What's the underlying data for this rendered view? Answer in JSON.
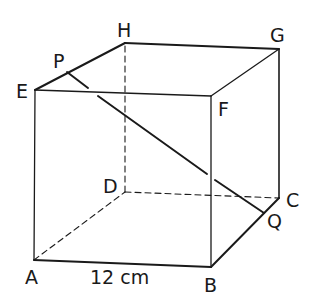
{
  "diagram": {
    "type": "cube",
    "vertices": {
      "A": {
        "label": "A",
        "x": 34,
        "y": 260
      },
      "B": {
        "label": "B",
        "x": 211,
        "y": 267
      },
      "C": {
        "label": "C",
        "x": 279,
        "y": 198
      },
      "D": {
        "label": "D",
        "x": 125,
        "y": 192
      },
      "E": {
        "label": "E",
        "x": 35,
        "y": 90
      },
      "F": {
        "label": "F",
        "x": 211,
        "y": 96
      },
      "G": {
        "label": "G",
        "x": 279,
        "y": 49
      },
      "H": {
        "label": "H",
        "x": 125,
        "y": 43
      }
    },
    "points": {
      "P": {
        "label": "P",
        "x": 67,
        "y": 72
      },
      "Q": {
        "label": "Q",
        "x": 264,
        "y": 213
      }
    },
    "dimension": {
      "edge": "AB",
      "label": "12 cm"
    },
    "colors": {
      "line": "#1a1a1a",
      "background": "#ffffff"
    }
  }
}
